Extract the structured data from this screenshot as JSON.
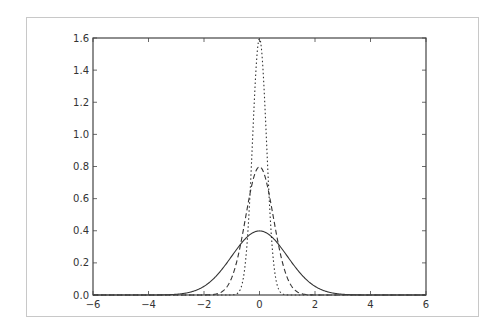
{
  "chart_data": {
    "type": "line",
    "title": "",
    "xlabel": "",
    "ylabel": "",
    "xlim": [
      -6,
      6
    ],
    "ylim": [
      0,
      1.6
    ],
    "grid": false,
    "legend": null,
    "x_ticks": [
      "−6",
      "−4",
      "−2",
      "0",
      "2",
      "4",
      "6"
    ],
    "x_tick_values": [
      -6,
      -4,
      -2,
      0,
      2,
      4,
      6
    ],
    "y_ticks": [
      "0.0",
      "0.2",
      "0.4",
      "0.6",
      "0.8",
      "1.0",
      "1.2",
      "1.4",
      "1.6"
    ],
    "y_tick_values": [
      0,
      0.2,
      0.4,
      0.6,
      0.8,
      1.0,
      1.2,
      1.4,
      1.6
    ],
    "series": [
      {
        "name": "normal sigma=1.0",
        "style": "solid",
        "mu": 0,
        "sigma": 1.0,
        "peak": 0.4,
        "x": [
          -4,
          -3,
          -2,
          -1.5,
          -1,
          -0.5,
          0,
          0.5,
          1,
          1.5,
          2,
          3,
          4
        ],
        "y": [
          0.0001,
          0.004,
          0.054,
          0.13,
          0.242,
          0.352,
          0.399,
          0.352,
          0.242,
          0.13,
          0.054,
          0.004,
          0.0001
        ]
      },
      {
        "name": "normal sigma=0.5",
        "style": "dashed",
        "mu": 0,
        "sigma": 0.5,
        "peak": 0.8,
        "x": [
          -2,
          -1.5,
          -1,
          -0.5,
          0,
          0.5,
          1,
          1.5,
          2
        ],
        "y": [
          0.0003,
          0.009,
          0.108,
          0.484,
          0.798,
          0.484,
          0.108,
          0.009,
          0.0003
        ]
      },
      {
        "name": "normal sigma=0.25",
        "style": "dashdot",
        "mu": 0,
        "sigma": 0.25,
        "peak": 1.6,
        "x": [
          -1,
          -0.75,
          -0.5,
          -0.25,
          0,
          0.25,
          0.5,
          0.75,
          1
        ],
        "y": [
          0.0005,
          0.018,
          0.216,
          0.968,
          1.596,
          0.968,
          0.216,
          0.018,
          0.0005
        ]
      }
    ],
    "colors": {
      "line": "#333333",
      "axes": "#444444",
      "frame": "#c8c8c8",
      "text": "#333333"
    }
  }
}
